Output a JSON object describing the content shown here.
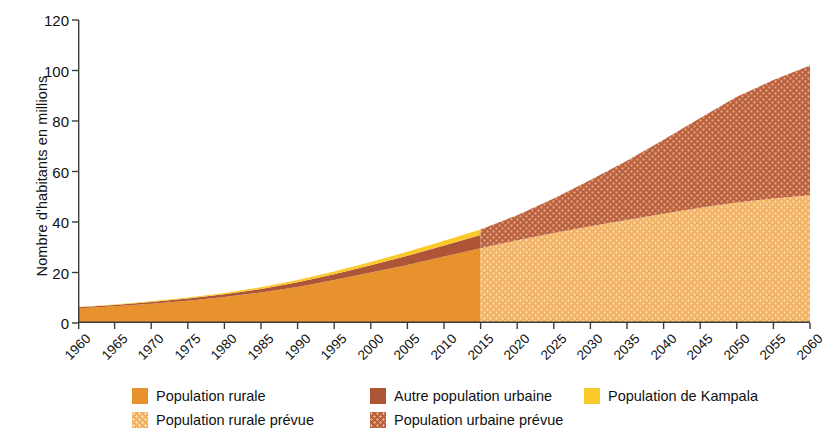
{
  "chart_data": {
    "type": "area",
    "title": "",
    "subtitle": "",
    "xlabel": "",
    "ylabel": "Nombre d'habitants en millions",
    "stacked": true,
    "xlim": [
      1960,
      2060
    ],
    "ylim": [
      0,
      120
    ],
    "grid": false,
    "legend_position": "bottom",
    "forecast_start": 2015,
    "x_ticks": [
      "1960",
      "1965",
      "1970",
      "1975",
      "1980",
      "1985",
      "1990",
      "1995",
      "2000",
      "2005",
      "2010",
      "2015",
      "2020",
      "2025",
      "2030",
      "2035",
      "2040",
      "2045",
      "2050",
      "2055",
      "2060"
    ],
    "y_ticks": [
      "0",
      "20",
      "40",
      "60",
      "80",
      "100",
      "120"
    ],
    "x": [
      1960,
      1965,
      1970,
      1975,
      1980,
      1985,
      1990,
      1995,
      2000,
      2005,
      2010,
      2015,
      2020,
      2025,
      2030,
      2035,
      2040,
      2045,
      2050,
      2055,
      2060
    ],
    "series": [
      {
        "name": "Population rurale",
        "color": "#E8922E",
        "pattern": "solid",
        "range": "historic",
        "values": [
          5.8,
          6.6,
          7.6,
          8.8,
          10.3,
          12.1,
          14.3,
          17.0,
          20.0,
          23.0,
          26.3,
          29.6,
          null,
          null,
          null,
          null,
          null,
          null,
          null,
          null,
          null
        ]
      },
      {
        "name": "Population rurale prévue",
        "color": "#F3B263",
        "pattern": "dotted",
        "range": "forecast",
        "values": [
          null,
          null,
          null,
          null,
          null,
          null,
          null,
          null,
          null,
          null,
          null,
          29.6,
          32.8,
          35.6,
          38.3,
          40.8,
          43.3,
          45.6,
          47.7,
          49.3,
          50.6
        ]
      },
      {
        "name": "Autre population urbaine",
        "color": "#AD5536",
        "pattern": "solid",
        "range": "historic",
        "values": [
          0.4,
          0.5,
          0.7,
          0.9,
          1.1,
          1.4,
          1.8,
          2.3,
          2.9,
          3.6,
          4.4,
          5.3,
          null,
          null,
          null,
          null,
          null,
          null,
          null,
          null,
          null
        ]
      },
      {
        "name": "Population urbaine prévue",
        "color": "#B8603F",
        "pattern": "dotted",
        "range": "forecast",
        "values": [
          null,
          null,
          null,
          null,
          null,
          null,
          null,
          null,
          null,
          null,
          null,
          7.4,
          9.9,
          13.7,
          18.3,
          23.5,
          29.3,
          35.6,
          41.9,
          46.9,
          51.4
        ]
      },
      {
        "name": "Population de Kampala",
        "color": "#FBC92A",
        "pattern": "solid",
        "range": "historic",
        "values": [
          0.15,
          0.2,
          0.3,
          0.4,
          0.5,
          0.7,
          0.9,
          1.1,
          1.3,
          1.6,
          1.9,
          2.1,
          null,
          null,
          null,
          null,
          null,
          null,
          null,
          null,
          null
        ]
      }
    ],
    "totals": {
      "1960": 6.35,
      "2015": 37.0,
      "2060": 102.0
    }
  },
  "axes": {
    "ylabel": "Nombre d'habitants en millions"
  },
  "legend": {
    "items": [
      {
        "label": "Population rurale",
        "swatch": "legend-swatch-rural",
        "color": "#E8922E",
        "pattern": "solid"
      },
      {
        "label": "Population rurale prévue",
        "swatch": "legend-swatch-rural-prevue",
        "color": "#F3B263",
        "pattern": "dotted"
      },
      {
        "label": "Autre population urbaine",
        "swatch": "legend-swatch-urbaine",
        "color": "#AD5536",
        "pattern": "solid"
      },
      {
        "label": "Population urbaine prévue",
        "swatch": "legend-swatch-urbaine-prevue",
        "color": "#B8603F",
        "pattern": "dotted"
      },
      {
        "label": "Population de Kampala",
        "swatch": "legend-swatch-kampala",
        "color": "#FBC92A",
        "pattern": "solid"
      }
    ]
  }
}
